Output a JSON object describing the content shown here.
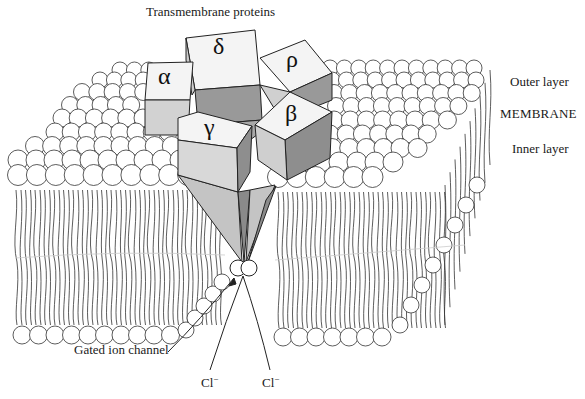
{
  "figure": {
    "title": "Transmembrane proteins",
    "membrane_labels": {
      "outer": "Outer layer",
      "membrane": "MEMBRANE",
      "inner": "Inner layer"
    },
    "channel_label": "Gated ion channel",
    "ions": [
      {
        "symbol": "Cl",
        "charge": "−"
      },
      {
        "symbol": "Cl",
        "charge": "−"
      }
    ],
    "subunits": [
      {
        "id": "alpha",
        "glyph": "α"
      },
      {
        "id": "delta",
        "glyph": "δ"
      },
      {
        "id": "rho",
        "glyph": "ρ"
      },
      {
        "id": "gamma",
        "glyph": "γ"
      },
      {
        "id": "beta",
        "glyph": "β"
      }
    ],
    "colors": {
      "line": "#222222",
      "face_light": "#f4f4f4",
      "face_mid": "#c8c8c8",
      "face_dark": "#8e8e8e",
      "funnel": "#bdbdbd",
      "background": "#ffffff"
    }
  }
}
